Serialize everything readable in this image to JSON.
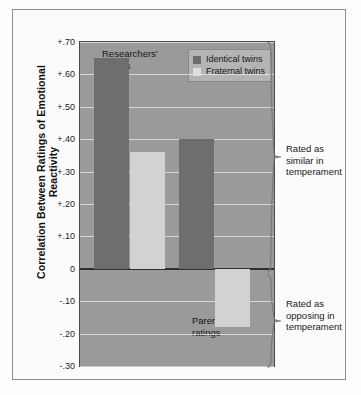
{
  "chart_data": {
    "type": "bar",
    "title": "",
    "xlabel": "",
    "ylabel": "Correlation Between Ratings of Emotional Reactivity",
    "ylim": [
      -0.3,
      0.7
    ],
    "ytick_labels": [
      "+.70",
      "+.60",
      "+.50",
      "+.40",
      "+.30",
      "+.20",
      "+.10",
      "0",
      "-.10",
      "-.20",
      "-.30"
    ],
    "ytick_values": [
      0.7,
      0.6,
      0.5,
      0.4,
      0.3,
      0.2,
      0.1,
      0,
      -0.1,
      -0.2,
      -0.3
    ],
    "grid": true,
    "legend_position": "top-right",
    "categories": [
      "Researchers' ratings",
      "Parents' ratings"
    ],
    "series": [
      {
        "name": "Identical twins",
        "color": "#6e6e6e",
        "values": [
          0.65,
          0.4
        ]
      },
      {
        "name": "Fraternal twins",
        "color": "#d2d2d2",
        "values": [
          0.36,
          -0.18
        ]
      }
    ],
    "annotations": [
      {
        "text": "Rated as similar in temperament",
        "range": [
          0,
          0.7
        ]
      },
      {
        "text": "Rated as opposing in temperament",
        "range": [
          -0.3,
          0
        ]
      }
    ]
  },
  "legend": {
    "items": [
      {
        "label": "Identical twins"
      },
      {
        "label": "Fraternal twins"
      }
    ]
  },
  "category_labels": [
    {
      "line1": "Researchers'",
      "line2": "ratings"
    },
    {
      "line1": "Parents'",
      "line2": "ratings"
    }
  ],
  "annotations": [
    {
      "line1": "Rated as",
      "line2": "similar in",
      "line3": "temperament"
    },
    {
      "line1": "Rated as",
      "line2": "opposing in",
      "line3": "temperament"
    }
  ],
  "axis": {
    "y_title": "Correlation Between Ratings of Emotional Reactivity"
  }
}
